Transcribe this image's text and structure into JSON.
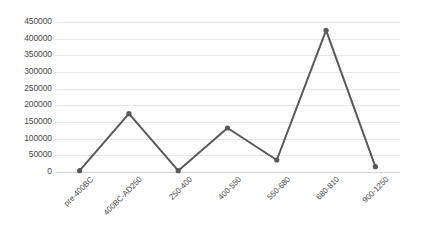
{
  "chart_data": {
    "type": "line",
    "title": "",
    "subtitle": "",
    "xlabel": "",
    "ylabel": "",
    "categories": [
      "pre-400BC",
      "400BC-AD250",
      "250-400",
      "400-550",
      "550-680",
      "680-810",
      "900-1250"
    ],
    "values": [
      4000,
      175000,
      4000,
      132000,
      36000,
      425000,
      16000
    ],
    "series": [
      {
        "name": "Series 1",
        "values": [
          4000,
          175000,
          4000,
          132000,
          36000,
          425000,
          16000
        ]
      }
    ],
    "ylim": [
      0,
      450000
    ],
    "ytick_step": 50000,
    "ytick_labels": [
      "450000",
      "400000",
      "350000",
      "300000",
      "250000",
      "200000",
      "150000",
      "100000",
      "50000",
      "0"
    ],
    "grid": true,
    "grid_axis": "y",
    "legend": false,
    "legend_position": "none",
    "markers": true,
    "marker_shape": "circle",
    "line_color": "#595959",
    "marker_color": "#595959",
    "grid_color": "#e8e8e8",
    "axis_color": "#d4d4d4",
    "background_color": "#ffffff",
    "text_color": "#4a4a4a",
    "xtick_rotation": -45
  }
}
